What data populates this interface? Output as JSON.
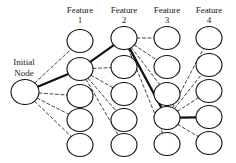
{
  "figure": {
    "type": "feature-selection-graph-diagram",
    "background_color": "#ffffff",
    "stroke_color": "#111111",
    "width": 236,
    "height": 163
  },
  "root": {
    "label_line1": "Initial",
    "label_line2": "Node",
    "cx": 25,
    "cy": 92,
    "rx": 14,
    "ry": 12.5
  },
  "columns": [
    {
      "id": "feature-1",
      "label_line1": "Feature",
      "label_line2": "1",
      "label_x": 53,
      "label_y": 5,
      "cx": 80,
      "node_count": 5,
      "nodes_cy": [
        41,
        69,
        96,
        120,
        145
      ]
    },
    {
      "id": "feature-2",
      "label_line1": "Feature",
      "label_line2": "2",
      "label_x": 95,
      "label_y": 5,
      "cx": 124,
      "node_count": 5,
      "nodes_cy": [
        38,
        67,
        94,
        120,
        145
      ]
    },
    {
      "id": "feature-3",
      "label_line1": "Feature",
      "label_line2": "3",
      "label_x": 140,
      "label_y": 5,
      "cx": 167,
      "node_count": 5,
      "nodes_cy": [
        38,
        67,
        94,
        118,
        144
      ]
    },
    {
      "id": "feature-4",
      "label_line1": "Feature",
      "label_line2": "4",
      "label_x": 182,
      "label_y": 5,
      "cx": 209,
      "node_count": 5,
      "nodes_cy": [
        38,
        65,
        91,
        117,
        143
      ]
    }
  ],
  "node_shape": {
    "rx": 13,
    "ry": 11.5
  },
  "edges": {
    "selected_path": [
      {
        "from": "root",
        "to": "feature-1.node-2"
      },
      {
        "from": "feature-1.node-2",
        "to": "feature-2.node-1"
      },
      {
        "from": "feature-2.node-1",
        "to": "feature-3.node-4"
      },
      {
        "from": "feature-3.node-4",
        "to": "feature-4.node-4"
      }
    ],
    "candidate_groups": [
      {
        "from": "root",
        "to_column": "feature-1",
        "to_nodes": [
          1,
          3,
          4,
          5
        ]
      },
      {
        "from": "feature-1.node-2",
        "to_column": "feature-2",
        "to_nodes": [
          2,
          3,
          4,
          5
        ]
      },
      {
        "from": "feature-2.node-1",
        "to_column": "feature-3",
        "to_nodes": [
          1,
          2,
          3,
          5
        ]
      },
      {
        "from": "feature-3.node-4",
        "to_column": "feature-4",
        "to_nodes": [
          1,
          2,
          3,
          5
        ]
      }
    ]
  },
  "style": {
    "selected_edge_width": 2.2,
    "candidate_edge_width": 0.8,
    "candidate_dash": "3,2.5",
    "node_stroke_width": 1.1
  }
}
